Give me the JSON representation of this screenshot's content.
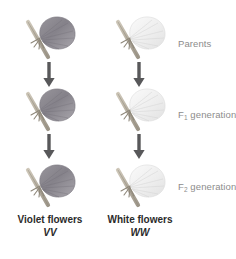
{
  "diagram": {
    "colors": {
      "violet_petal": "#8f8c92",
      "violet_petal_dark": "#6e6b73",
      "white_petal": "#ececec",
      "white_petal_edge": "#d8d8d8",
      "stem": "#b9b2a4",
      "stem_dark": "#8e877a",
      "arrow": "#58585a",
      "label_gray": "#8c8c8c",
      "caption_text": "#2b2b2b",
      "background": "#ffffff"
    }
  },
  "rows": [
    {
      "key": "parents",
      "label": "Parents",
      "label_base": "Parents",
      "label_sub": ""
    },
    {
      "key": "f1",
      "label": "F1 generation",
      "label_base": "F",
      "label_sub": "1",
      "label_rest": " generation"
    },
    {
      "key": "f2",
      "label": "F2 generation",
      "label_base": "F",
      "label_sub": "2",
      "label_rest": " generation"
    }
  ],
  "columns": [
    {
      "key": "violet",
      "flower_type": "violet-flower",
      "caption_name": "Violet flowers",
      "caption_genotype": "VV"
    },
    {
      "key": "white",
      "flower_type": "white-flower",
      "caption_name": "White flowers",
      "caption_genotype": "WW"
    }
  ],
  "arrows": {
    "direction": "down",
    "count": 4,
    "name": "down-arrow"
  }
}
